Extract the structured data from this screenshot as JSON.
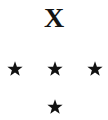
{
  "canvas": {
    "width": 108,
    "height": 120,
    "background_color": "#ffffff",
    "ink_color": "#111111"
  },
  "letter": {
    "text": "X",
    "name": "letter-x",
    "center_x": 55,
    "center_y": 20,
    "font_size_px": 28,
    "style": "serif-bold"
  },
  "stars": {
    "count": 4,
    "symbol": "★",
    "color": "#111111",
    "size_px": 16,
    "items": [
      {
        "label": "star-left",
        "x": 15,
        "y": 69
      },
      {
        "label": "star-middle",
        "x": 55,
        "y": 69
      },
      {
        "label": "star-right",
        "x": 95,
        "y": 69
      },
      {
        "label": "star-bottom",
        "x": 55,
        "y": 107
      }
    ]
  }
}
